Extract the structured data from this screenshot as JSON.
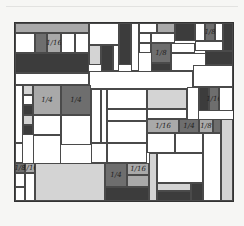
{
  "artwork": {
    "description": "Hand-drawn grid of rectangles shaded in grays with fraction labels",
    "colors": {
      "dark": "#3c3c3c",
      "mid": "#6e6e6e",
      "light": "#a9a9a9",
      "pale": "#d4d4d4",
      "white": "#ffffff",
      "line": "#333333"
    },
    "cells": [
      {
        "x": 0,
        "y": 0,
        "w": 74,
        "h": 10,
        "c": "light"
      },
      {
        "x": 0,
        "y": 10,
        "w": 20,
        "h": 20,
        "c": "white"
      },
      {
        "x": 20,
        "y": 10,
        "w": 12,
        "h": 20,
        "c": "mid"
      },
      {
        "x": 32,
        "y": 10,
        "w": 14,
        "h": 20,
        "c": "light",
        "label": "1/16"
      },
      {
        "x": 46,
        "y": 10,
        "w": 14,
        "h": 20,
        "c": "white"
      },
      {
        "x": 60,
        "y": 10,
        "w": 14,
        "h": 20,
        "c": "white"
      },
      {
        "x": 0,
        "y": 30,
        "w": 74,
        "h": 20,
        "c": "dark"
      },
      {
        "x": 74,
        "y": 0,
        "w": 30,
        "h": 22,
        "c": "white"
      },
      {
        "x": 74,
        "y": 22,
        "w": 12,
        "h": 20,
        "c": "pale"
      },
      {
        "x": 86,
        "y": 22,
        "w": 12,
        "h": 26,
        "c": "dark"
      },
      {
        "x": 98,
        "y": 22,
        "w": 6,
        "h": 26,
        "c": "white"
      },
      {
        "x": 104,
        "y": 0,
        "w": 12,
        "h": 42,
        "c": "dark"
      },
      {
        "x": 116,
        "y": 0,
        "w": 8,
        "h": 48,
        "c": "white"
      },
      {
        "x": 124,
        "y": 0,
        "w": 18,
        "h": 10,
        "c": "white"
      },
      {
        "x": 142,
        "y": 0,
        "w": 18,
        "h": 10,
        "c": "light"
      },
      {
        "x": 160,
        "y": 0,
        "w": 20,
        "h": 18,
        "c": "dark"
      },
      {
        "x": 180,
        "y": 0,
        "w": 10,
        "h": 18,
        "c": "white"
      },
      {
        "x": 190,
        "y": 0,
        "w": 10,
        "h": 18,
        "c": "mid",
        "label": "1/8"
      },
      {
        "x": 200,
        "y": 0,
        "w": 8,
        "h": 18,
        "c": "white"
      },
      {
        "x": 208,
        "y": 0,
        "w": 10,
        "h": 28,
        "c": "dark"
      },
      {
        "x": 124,
        "y": 10,
        "w": 12,
        "h": 10,
        "c": "white"
      },
      {
        "x": 136,
        "y": 10,
        "w": 24,
        "h": 10,
        "c": "white"
      },
      {
        "x": 124,
        "y": 20,
        "w": 12,
        "h": 10,
        "c": "white"
      },
      {
        "x": 136,
        "y": 20,
        "w": 20,
        "h": 20,
        "c": "mid",
        "label": "1/8"
      },
      {
        "x": 156,
        "y": 20,
        "w": 24,
        "h": 10,
        "c": "white"
      },
      {
        "x": 180,
        "y": 18,
        "w": 28,
        "h": 10,
        "c": "white"
      },
      {
        "x": 136,
        "y": 40,
        "w": 20,
        "h": 8,
        "c": "dark"
      },
      {
        "x": 156,
        "y": 30,
        "w": 50,
        "h": 18,
        "c": "white"
      },
      {
        "x": 190,
        "y": 28,
        "w": 28,
        "h": 14,
        "c": "dark"
      },
      {
        "x": 0,
        "y": 50,
        "w": 74,
        "h": 12,
        "c": "white"
      },
      {
        "x": 74,
        "y": 48,
        "w": 104,
        "h": 18,
        "c": "white"
      },
      {
        "x": 178,
        "y": 42,
        "w": 40,
        "h": 22,
        "c": "white"
      },
      {
        "x": 0,
        "y": 62,
        "w": 8,
        "h": 58,
        "c": "white"
      },
      {
        "x": 8,
        "y": 62,
        "w": 10,
        "h": 10,
        "c": "pale"
      },
      {
        "x": 8,
        "y": 72,
        "w": 10,
        "h": 10,
        "c": "white"
      },
      {
        "x": 8,
        "y": 82,
        "w": 10,
        "h": 10,
        "c": "dark"
      },
      {
        "x": 8,
        "y": 92,
        "w": 10,
        "h": 10,
        "c": "pale"
      },
      {
        "x": 8,
        "y": 102,
        "w": 10,
        "h": 10,
        "c": "dark"
      },
      {
        "x": 18,
        "y": 62,
        "w": 28,
        "h": 30,
        "c": "light",
        "label": "1/4"
      },
      {
        "x": 46,
        "y": 62,
        "w": 30,
        "h": 30,
        "c": "mid",
        "label": "1/4"
      },
      {
        "x": 76,
        "y": 66,
        "w": 10,
        "h": 54,
        "c": "white"
      },
      {
        "x": 86,
        "y": 66,
        "w": 6,
        "h": 54,
        "c": "white"
      },
      {
        "x": 92,
        "y": 66,
        "w": 40,
        "h": 20,
        "c": "white"
      },
      {
        "x": 132,
        "y": 66,
        "w": 40,
        "h": 20,
        "c": "pale"
      },
      {
        "x": 172,
        "y": 64,
        "w": 12,
        "h": 56,
        "c": "white"
      },
      {
        "x": 184,
        "y": 64,
        "w": 10,
        "h": 24,
        "c": "dark"
      },
      {
        "x": 194,
        "y": 64,
        "w": 10,
        "h": 24,
        "c": "mid",
        "label": "1/16"
      },
      {
        "x": 204,
        "y": 64,
        "w": 14,
        "h": 24,
        "c": "white"
      },
      {
        "x": 18,
        "y": 92,
        "w": 28,
        "h": 20,
        "c": "white"
      },
      {
        "x": 46,
        "y": 92,
        "w": 30,
        "h": 30,
        "c": "white"
      },
      {
        "x": 92,
        "y": 86,
        "w": 40,
        "h": 12,
        "c": "white"
      },
      {
        "x": 132,
        "y": 86,
        "w": 40,
        "h": 10,
        "c": "white"
      },
      {
        "x": 132,
        "y": 96,
        "w": 32,
        "h": 14,
        "c": "light",
        "label": "1/16"
      },
      {
        "x": 164,
        "y": 96,
        "w": 20,
        "h": 14,
        "c": "mid",
        "label": "1/4"
      },
      {
        "x": 184,
        "y": 96,
        "w": 14,
        "h": 14,
        "c": "light",
        "label": "1/8"
      },
      {
        "x": 198,
        "y": 96,
        "w": 8,
        "h": 14,
        "c": "mid"
      },
      {
        "x": 206,
        "y": 96,
        "w": 12,
        "h": 82,
        "c": "pale"
      },
      {
        "x": 18,
        "y": 112,
        "w": 28,
        "h": 32,
        "c": "white"
      },
      {
        "x": 92,
        "y": 98,
        "w": 40,
        "h": 22,
        "c": "white"
      },
      {
        "x": 132,
        "y": 110,
        "w": 28,
        "h": 20,
        "c": "white"
      },
      {
        "x": 160,
        "y": 110,
        "w": 28,
        "h": 20,
        "c": "white"
      },
      {
        "x": 188,
        "y": 110,
        "w": 18,
        "h": 68,
        "c": "white"
      },
      {
        "x": 0,
        "y": 120,
        "w": 8,
        "h": 20,
        "c": "white"
      },
      {
        "x": 0,
        "y": 140,
        "w": 10,
        "h": 10,
        "c": "mid",
        "label": "1/8"
      },
      {
        "x": 10,
        "y": 140,
        "w": 10,
        "h": 10,
        "c": "light",
        "label": "1/16"
      },
      {
        "x": 20,
        "y": 140,
        "w": 70,
        "h": 38,
        "c": "pale"
      },
      {
        "x": 0,
        "y": 150,
        "w": 10,
        "h": 14,
        "c": "white"
      },
      {
        "x": 0,
        "y": 164,
        "w": 10,
        "h": 14,
        "c": "white"
      },
      {
        "x": 10,
        "y": 150,
        "w": 10,
        "h": 28,
        "c": "white"
      },
      {
        "x": 76,
        "y": 120,
        "w": 16,
        "h": 20,
        "c": "white"
      },
      {
        "x": 92,
        "y": 120,
        "w": 40,
        "h": 20,
        "c": "white"
      },
      {
        "x": 90,
        "y": 140,
        "w": 22,
        "h": 24,
        "c": "mid",
        "label": "1/4"
      },
      {
        "x": 112,
        "y": 140,
        "w": 22,
        "h": 12,
        "c": "light",
        "label": "1/16"
      },
      {
        "x": 112,
        "y": 152,
        "w": 22,
        "h": 12,
        "c": "light"
      },
      {
        "x": 90,
        "y": 164,
        "w": 44,
        "h": 14,
        "c": "dark"
      },
      {
        "x": 134,
        "y": 130,
        "w": 8,
        "h": 48,
        "c": "pale"
      },
      {
        "x": 142,
        "y": 130,
        "w": 46,
        "h": 30,
        "c": "white"
      },
      {
        "x": 142,
        "y": 160,
        "w": 34,
        "h": 8,
        "c": "pale"
      },
      {
        "x": 142,
        "y": 168,
        "w": 34,
        "h": 10,
        "c": "dark"
      },
      {
        "x": 176,
        "y": 160,
        "w": 12,
        "h": 18,
        "c": "dark"
      }
    ]
  }
}
